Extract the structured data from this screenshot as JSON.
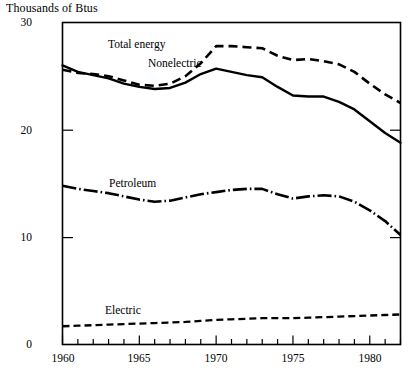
{
  "chart_data": {
    "type": "line",
    "title": "Thousands of Btus",
    "xlabel": "",
    "ylabel": "",
    "xlim": [
      1960,
      1982
    ],
    "ylim": [
      0,
      30
    ],
    "yticks": [
      0,
      10,
      20,
      30
    ],
    "ytick_labels": [
      "0",
      "10",
      "20",
      "30"
    ],
    "xticks": [
      1960,
      1961,
      1962,
      1963,
      1964,
      1965,
      1966,
      1967,
      1968,
      1969,
      1970,
      1971,
      1972,
      1973,
      1974,
      1975,
      1976,
      1977,
      1978,
      1979,
      1980,
      1981,
      1982
    ],
    "xtick_labels_shown": [
      "1960",
      "1965",
      "1970",
      "1975",
      "1980"
    ],
    "xtick_labels_shown_at": [
      1960,
      1965,
      1970,
      1975,
      1980
    ],
    "grid": false,
    "legend": "inline-annotations",
    "x": [
      1960,
      1961,
      1962,
      1963,
      1964,
      1965,
      1966,
      1967,
      1968,
      1969,
      1970,
      1971,
      1972,
      1973,
      1974,
      1975,
      1976,
      1977,
      1978,
      1979,
      1980,
      1981,
      1982
    ],
    "series": [
      {
        "name": "Total energy",
        "style": "dashed",
        "color": "#000000",
        "label_position": {
          "x": 1965.4,
          "y": 28.2
        },
        "values": [
          25.6,
          25.3,
          25.2,
          25.0,
          24.6,
          24.2,
          24.1,
          24.3,
          25.0,
          26.2,
          27.8,
          27.8,
          27.7,
          27.6,
          26.9,
          26.5,
          26.6,
          26.4,
          26.1,
          25.4,
          24.3,
          23.3,
          22.5
        ]
      },
      {
        "name": "Nonelectric",
        "style": "solid",
        "color": "#000000",
        "label_position": {
          "x": 1967.0,
          "y": 25.4
        },
        "values": [
          26.0,
          25.4,
          25.1,
          24.8,
          24.3,
          24.0,
          23.8,
          23.9,
          24.4,
          25.2,
          25.7,
          25.4,
          25.1,
          24.9,
          24.0,
          23.2,
          23.1,
          23.1,
          22.6,
          21.9,
          20.8,
          19.7,
          18.8
        ]
      },
      {
        "name": "Petroleum",
        "style": "dash-dot",
        "color": "#000000",
        "label_position": {
          "x": 1965.2,
          "y": 15.6
        },
        "values": [
          14.8,
          14.5,
          14.3,
          14.1,
          13.8,
          13.5,
          13.3,
          13.4,
          13.7,
          14.0,
          14.2,
          14.4,
          14.5,
          14.5,
          14.0,
          13.6,
          13.8,
          13.9,
          13.8,
          13.3,
          12.5,
          11.5,
          10.2
        ]
      },
      {
        "name": "Electric",
        "style": "dashed-fine",
        "color": "#000000",
        "label_position": {
          "x": 1964.8,
          "y": 3.6
        },
        "values": [
          1.7,
          1.75,
          1.8,
          1.85,
          1.9,
          1.95,
          2.0,
          2.05,
          2.1,
          2.2,
          2.3,
          2.35,
          2.4,
          2.45,
          2.45,
          2.45,
          2.5,
          2.55,
          2.6,
          2.65,
          2.7,
          2.75,
          2.8
        ]
      }
    ]
  },
  "axes": {
    "title": "Thousands of Btus",
    "y_labels": [
      "30",
      "20",
      "10",
      "0"
    ],
    "x_labels": [
      "1960",
      "1965",
      "1970",
      "1975",
      "1980"
    ]
  },
  "annotations": {
    "total_energy": "Total energy",
    "nonelectric": "Nonelectric",
    "petroleum": "Petroleum",
    "electric": "Electric"
  }
}
